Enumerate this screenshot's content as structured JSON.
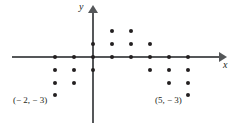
{
  "figure": {
    "width": 236,
    "height": 125,
    "background_color": "#ffffff",
    "axis_color": "#555759",
    "point_color": "#231f20"
  },
  "axes": {
    "x_label": "x",
    "y_label": "y"
  },
  "annotations": [
    {
      "id": "left",
      "text": "(− 2, − 3)"
    },
    {
      "id": "right",
      "text": "(5, − 3)"
    }
  ],
  "chart_data": {
    "type": "scatter",
    "title": "",
    "xlabel": "x",
    "ylabel": "y",
    "grid": false,
    "legend": null,
    "xlim": [
      -4.5,
      7
    ],
    "ylim": [
      -4,
      3
    ],
    "origin_px": {
      "x": 93,
      "y": 57
    },
    "unit_px": {
      "x": 19,
      "y": 12.8
    },
    "x": [
      -2,
      -2,
      -2,
      -1,
      -1,
      -1,
      0,
      0,
      0,
      1,
      1,
      1,
      2,
      2,
      2,
      3,
      3,
      3,
      4,
      4,
      4,
      5,
      5,
      5
    ],
    "y": [
      0,
      -1,
      -2,
      -3,
      0,
      -1,
      -2,
      1,
      0,
      -1,
      2,
      1,
      0,
      2,
      1,
      0,
      -1,
      1,
      0,
      -1,
      -2,
      0,
      -1,
      -2
    ],
    "points": [
      {
        "x": -2,
        "y": 0
      },
      {
        "x": -2,
        "y": -1
      },
      {
        "x": -2,
        "y": -2
      },
      {
        "x": -2,
        "y": -3
      },
      {
        "x": -1,
        "y": 0
      },
      {
        "x": -1,
        "y": -1
      },
      {
        "x": -1,
        "y": -2
      },
      {
        "x": 0,
        "y": 1
      },
      {
        "x": 0,
        "y": 0
      },
      {
        "x": 0,
        "y": -1
      },
      {
        "x": 1,
        "y": 2
      },
      {
        "x": 1,
        "y": 1
      },
      {
        "x": 1,
        "y": 0
      },
      {
        "x": 2,
        "y": 2
      },
      {
        "x": 2,
        "y": 1
      },
      {
        "x": 2,
        "y": 0
      },
      {
        "x": 3,
        "y": 1
      },
      {
        "x": 3,
        "y": 0
      },
      {
        "x": 3,
        "y": -1
      },
      {
        "x": 4,
        "y": 0
      },
      {
        "x": 4,
        "y": -1
      },
      {
        "x": 4,
        "y": -2
      },
      {
        "x": 5,
        "y": 0
      },
      {
        "x": 5,
        "y": -1
      },
      {
        "x": 5,
        "y": -2
      },
      {
        "x": 5,
        "y": -3
      }
    ],
    "annotated_points": [
      {
        "label": "(− 2, − 3)",
        "x": -2,
        "y": -3
      },
      {
        "label": "(5, − 3)",
        "x": 5,
        "y": -3
      }
    ]
  }
}
